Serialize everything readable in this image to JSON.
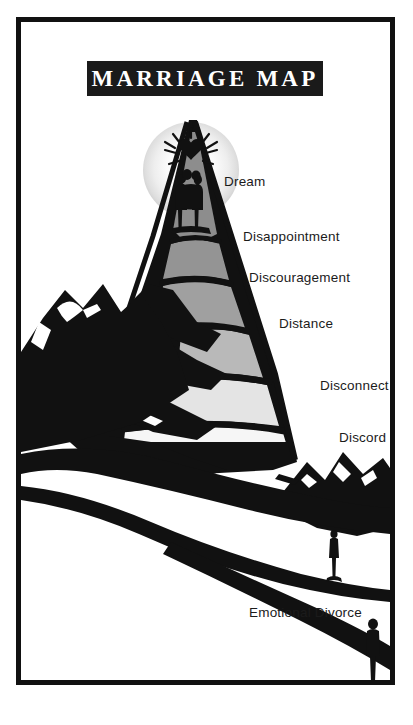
{
  "poster": {
    "title": "MARRIAGE MAP",
    "frame_color": "#111111",
    "background_color": "#ffffff",
    "ink_color": "#1b1b1b"
  },
  "stages": [
    {
      "id": "dream",
      "label": "Dream"
    },
    {
      "id": "disappointment",
      "label": "Disappointment"
    },
    {
      "id": "discouragement",
      "label": "Discouragement"
    },
    {
      "id": "distance",
      "label": "Distance"
    },
    {
      "id": "disconnect",
      "label": "Disconnect"
    },
    {
      "id": "discord",
      "label": "Discord"
    },
    {
      "id": "emotional-divorce",
      "label": "Emotional Divorce"
    }
  ],
  "artwork": {
    "sun_glow": "radial-gradient white to light gray",
    "summit_couple": "couple-silhouette-icon",
    "heart": "heart-icon",
    "sunburst_rays": "radiating-lines",
    "lone_figure_upper": "standing-person-silhouette",
    "lone_figure_lower": "standing-person-silhouette",
    "mountain_band_colors": [
      "#8d8d8d",
      "#9a9a9a",
      "#b6b6b6",
      "#d4d4d4",
      "#ededed",
      "#f7f7f7"
    ],
    "shadow_color": "#111111"
  }
}
